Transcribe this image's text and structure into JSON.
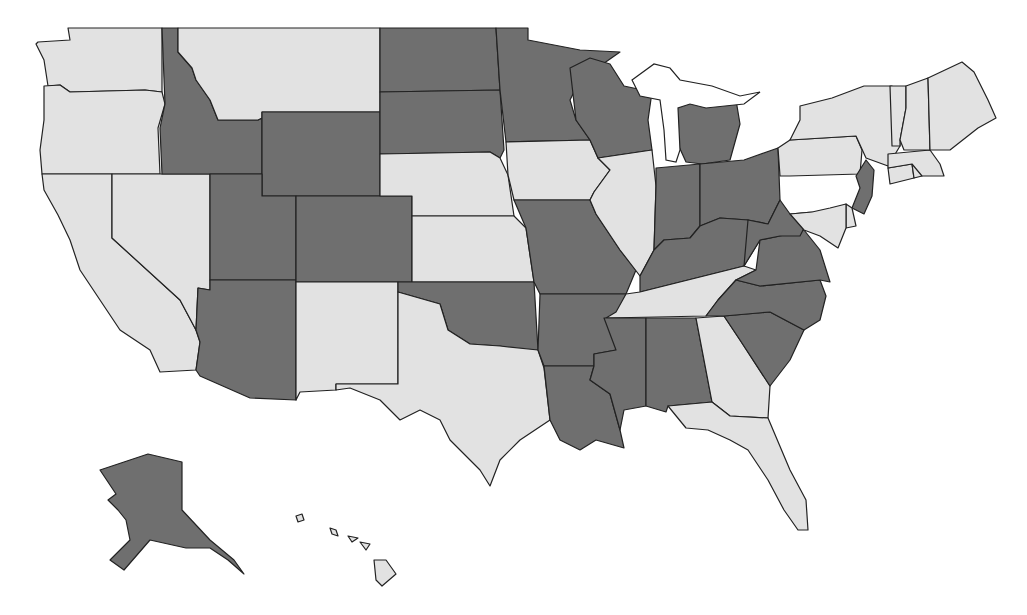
{
  "map": {
    "title": "United States choropleth map",
    "legend": [],
    "colors": {
      "dark": "#6f6f6f",
      "light": "#e2e2e2",
      "border": "#222222",
      "background": "#ffffff"
    },
    "states": [
      {
        "name": "Washington",
        "abbr": "WA",
        "category": "light"
      },
      {
        "name": "Oregon",
        "abbr": "OR",
        "category": "light"
      },
      {
        "name": "California",
        "abbr": "CA",
        "category": "light"
      },
      {
        "name": "Nevada",
        "abbr": "NV",
        "category": "light"
      },
      {
        "name": "Idaho",
        "abbr": "ID",
        "category": "dark"
      },
      {
        "name": "Montana",
        "abbr": "MT",
        "category": "light"
      },
      {
        "name": "Wyoming",
        "abbr": "WY",
        "category": "dark"
      },
      {
        "name": "Utah",
        "abbr": "UT",
        "category": "dark"
      },
      {
        "name": "Arizona",
        "abbr": "AZ",
        "category": "dark"
      },
      {
        "name": "Colorado",
        "abbr": "CO",
        "category": "dark"
      },
      {
        "name": "New Mexico",
        "abbr": "NM",
        "category": "light"
      },
      {
        "name": "North Dakota",
        "abbr": "ND",
        "category": "dark"
      },
      {
        "name": "South Dakota",
        "abbr": "SD",
        "category": "dark"
      },
      {
        "name": "Nebraska",
        "abbr": "NE",
        "category": "light"
      },
      {
        "name": "Kansas",
        "abbr": "KS",
        "category": "light"
      },
      {
        "name": "Oklahoma",
        "abbr": "OK",
        "category": "dark"
      },
      {
        "name": "Texas",
        "abbr": "TX",
        "category": "light"
      },
      {
        "name": "Minnesota",
        "abbr": "MN",
        "category": "dark"
      },
      {
        "name": "Iowa",
        "abbr": "IA",
        "category": "light"
      },
      {
        "name": "Missouri",
        "abbr": "MO",
        "category": "dark"
      },
      {
        "name": "Arkansas",
        "abbr": "AR",
        "category": "dark"
      },
      {
        "name": "Louisiana",
        "abbr": "LA",
        "category": "dark"
      },
      {
        "name": "Wisconsin",
        "abbr": "WI",
        "category": "dark"
      },
      {
        "name": "Illinois",
        "abbr": "IL",
        "category": "light"
      },
      {
        "name": "Michigan",
        "abbr": "MI",
        "category": "dark"
      },
      {
        "name": "Indiana",
        "abbr": "IN",
        "category": "dark"
      },
      {
        "name": "Ohio",
        "abbr": "OH",
        "category": "dark"
      },
      {
        "name": "Kentucky",
        "abbr": "KY",
        "category": "dark"
      },
      {
        "name": "Tennessee",
        "abbr": "TN",
        "category": "light"
      },
      {
        "name": "Mississippi",
        "abbr": "MS",
        "category": "dark"
      },
      {
        "name": "Alabama",
        "abbr": "AL",
        "category": "dark"
      },
      {
        "name": "Georgia",
        "abbr": "GA",
        "category": "light"
      },
      {
        "name": "Florida",
        "abbr": "FL",
        "category": "light"
      },
      {
        "name": "South Carolina",
        "abbr": "SC",
        "category": "dark"
      },
      {
        "name": "North Carolina",
        "abbr": "NC",
        "category": "dark"
      },
      {
        "name": "Virginia",
        "abbr": "VA",
        "category": "dark"
      },
      {
        "name": "West Virginia",
        "abbr": "WV",
        "category": "dark"
      },
      {
        "name": "Pennsylvania",
        "abbr": "PA",
        "category": "light"
      },
      {
        "name": "New York",
        "abbr": "NY",
        "category": "light"
      },
      {
        "name": "New Jersey",
        "abbr": "NJ",
        "category": "dark"
      },
      {
        "name": "Delaware",
        "abbr": "DE",
        "category": "light"
      },
      {
        "name": "Maryland",
        "abbr": "MD",
        "category": "light"
      },
      {
        "name": "Connecticut",
        "abbr": "CT",
        "category": "light"
      },
      {
        "name": "Rhode Island",
        "abbr": "RI",
        "category": "light"
      },
      {
        "name": "Massachusetts",
        "abbr": "MA",
        "category": "light"
      },
      {
        "name": "Vermont",
        "abbr": "VT",
        "category": "light"
      },
      {
        "name": "New Hampshire",
        "abbr": "NH",
        "category": "light"
      },
      {
        "name": "Maine",
        "abbr": "ME",
        "category": "light"
      },
      {
        "name": "Alaska",
        "abbr": "AK",
        "category": "dark"
      },
      {
        "name": "Hawaii",
        "abbr": "HI",
        "category": "light"
      }
    ]
  },
  "shapes": {
    "WA": "38,42 70,40 68,28 162,28 162,92 145,90 70,92 60,85 48,86 44,60 36,44",
    "OR": "44,86 60,85 70,92 145,90 162,92 165,104 158,128 160,174 42,174 40,150 44,120",
    "CA": "42,174 112,174 112,238 180,300 196,330 200,342 196,370 160,372 150,350 120,330 100,300 80,270 70,240 58,215 44,190",
    "NV": "112,174 210,174 210,290 198,288 196,330 180,300 112,238",
    "ID": "162,28 178,28 178,52 192,68 196,80 210,100 218,120 258,120 262,118 262,174 162,174 160,128 165,104",
    "MT": "178,28 380,28 380,112 262,112 262,118 258,120 218,120 210,100 196,80 192,68 178,52",
    "WY": "262,112 380,112 380,196 262,196",
    "UT": "210,174 262,174 262,196 296,196 296,280 210,280",
    "AZ": "210,280 296,280 296,400 250,398 200,376 196,370 200,342 196,330 198,288 210,290",
    "CO": "296,196 412,196 412,282 296,282",
    "NM": "296,282 398,282 398,384 336,384 336,390 300,392 296,400",
    "ND": "380,28 496,28 500,90 380,92",
    "SD": "380,92 500,90 504,150 500,158 490,152 380,154",
    "NE": "380,154 490,152 500,158 508,175 514,216 412,216 412,196 380,196",
    "KS": "412,216 514,216 526,228 534,282 412,282",
    "OK": "398,282 534,282 538,350 520,350 500,346 470,344 448,330 440,304 398,292",
    "TX": "398,292 440,304 448,330 470,344 500,346 538,350 544,368 550,420 520,440 500,460 490,486 480,470 450,440 440,420 420,410 400,420 380,400 350,388 336,390 336,384 398,384",
    "MN": "496,28 528,28 528,40 580,50 620,52 580,80 570,100 576,120 590,140 506,142 500,90",
    "IA": "506,142 590,140 598,158 610,170 594,192 590,200 514,200 508,175",
    "MO": "514,200 590,200 596,214 620,250 636,270 626,294 540,294 534,282 526,228",
    "AR": "540,294 626,294 620,310 616,350 594,354 594,366 544,366 538,350",
    "LA": "544,366 594,366 590,380 610,394 620,430 624,448 596,440 580,450 560,440 550,420",
    "WI": "570,68 590,58 610,64 624,86 652,92 648,120 652,150 598,158 590,140 576,120",
    "IL": "598,158 652,150 656,186 654,250 640,276 620,250 596,214 590,200 594,192 610,170",
    "MI": "670,106 698,100 710,92 736,100 740,124 730,160 702,164 686,162 676,140",
    "IN": "656,168 700,164 700,226 690,238 664,240 654,250 656,186",
    "OH": "700,164 744,160 778,148 780,200 768,224 748,220 720,218 700,226",
    "KY": "640,276 654,250 664,240 690,238 700,226 720,218 748,220 760,240 744,266 640,292",
    "TN": "616,312 626,294 640,292 744,266 756,270 736,280 718,300 706,316 606,318",
    "MS": "604,318 646,318 646,406 624,410 620,430 610,394 590,380 594,366 594,354 616,350",
    "AL": "646,318 696,318 712,402 668,406 666,412 646,406",
    "GA": "696,318 724,316 740,340 770,386 768,418 730,416 712,402",
    "FL": "668,406 712,402 730,416 768,418 790,470 806,500 808,530 798,530 784,510 768,480 748,450 730,440 708,430 686,428",
    "SC": "724,316 770,312 804,330 790,360 770,386 740,340",
    "NC": "718,300 736,280 760,286 820,280 826,296 820,320 804,330 770,312 724,316 706,316",
    "VA": "736,280 756,270 760,240 780,236 804,230 820,250 830,282 820,280 760,286",
    "WV": "748,220 768,224 780,200 790,214 812,212 800,236 780,236 760,240 744,266",
    "PA": "778,148 790,140 856,136 862,150 860,174 790,176 780,176",
    "NY": "790,140 800,120 800,106 832,98 864,86 892,86 900,118 900,146 888,166 866,158 856,136",
    "NJ": "856,176 866,160 874,170 872,196 864,214 852,208 860,188",
    "DE": "846,204 852,208 856,226 846,228",
    "MD": "790,214 812,212 830,208 846,204 846,228 838,248 820,236 804,230",
    "CT": "888,168 912,164 914,178 890,184",
    "RI": "912,164 920,164 922,176 914,178",
    "MA": "888,154 930,150 940,164 944,176 922,176 912,164 888,168",
    "VT": "890,86 906,86 906,108 900,140 900,146 892,146",
    "NH": "906,86 928,78 930,150 904,150 900,140 906,108",
    "ME": "928,78 962,62 974,72 988,100 996,118 978,128 950,150 930,150",
    "AK": "100,470 148,454 182,462 182,510 210,540 234,560 244,574 228,560 210,548 186,548 150,540 124,570 110,560 130,540 126,520 118,510 108,500 116,494",
    "HI_1": "296,516 302,514 304,520 298,522",
    "HI_2": "330,528 336,530 338,536 332,534",
    "HI_3": "348,536 358,538 352,542",
    "HI_4": "360,542 370,544 366,550",
    "HI_5": "374,560 386,560 396,574 382,586 376,580"
  },
  "lakes": {
    "great_lakes": "632,80 654,64 670,68 680,80 712,86 740,96 760,92 744,104 706,108 690,104 678,108 680,150 676,162 666,160 664,130 660,100 640,96"
  }
}
